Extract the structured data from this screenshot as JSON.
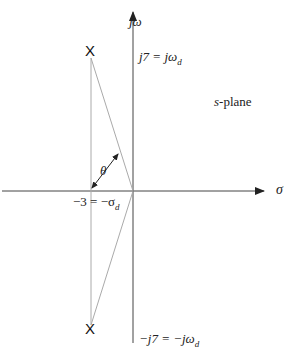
{
  "diagram": {
    "axes": {
      "horizontal_label": "σ",
      "vertical_label": "jω"
    },
    "plane_label": {
      "italic": "s",
      "text": "-plane"
    },
    "labels": {
      "upper_pole": "j7 = jω",
      "upper_pole_sub": "d",
      "lower_pole": "−j7 = −jω",
      "lower_pole_sub": "d",
      "real_part": "−3 = −σ",
      "real_part_sub": "d",
      "angle": "θ"
    },
    "poles": [
      {
        "marker": "X",
        "real": -3,
        "imag": 7
      },
      {
        "marker": "X",
        "real": -3,
        "imag": -7
      }
    ],
    "colors": {
      "axis": "#333333",
      "construction": "#aaaaaa"
    }
  }
}
